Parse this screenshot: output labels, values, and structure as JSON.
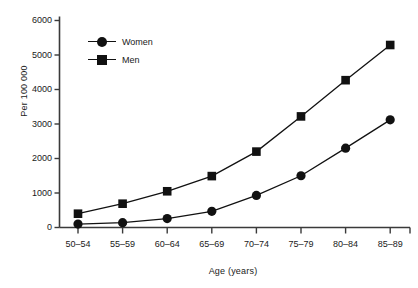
{
  "chart_data": {
    "type": "line",
    "title": "",
    "xlabel": "Age (years)",
    "ylabel": "Per 100 000",
    "categories": [
      "50–54",
      "55–59",
      "60–64",
      "65–69",
      "70–74",
      "75–79",
      "80–84",
      "85–89"
    ],
    "series": [
      {
        "name": "Women",
        "marker": "circle",
        "color": "#111111",
        "values": [
          100,
          140,
          260,
          470,
          930,
          1500,
          2300,
          3120
        ]
      },
      {
        "name": "Men",
        "marker": "square",
        "color": "#111111",
        "values": [
          400,
          690,
          1050,
          1490,
          2200,
          3220,
          4270,
          5290
        ]
      }
    ],
    "ylim": [
      0,
      6000
    ],
    "yticks": [
      0,
      1000,
      2000,
      3000,
      4000,
      5000,
      6000
    ],
    "ytick_labels": [
      "0",
      "1000",
      "2000",
      "3000",
      "4000",
      "5000",
      "6000"
    ],
    "grid": false,
    "legend_position": "upper left"
  },
  "legend": {
    "entries": [
      {
        "label": "Women",
        "marker": "circle-marker"
      },
      {
        "label": "Men",
        "marker": "square-marker"
      }
    ]
  },
  "axes": {
    "y_title": "Per 100 000",
    "x_title": "Age (years)"
  }
}
